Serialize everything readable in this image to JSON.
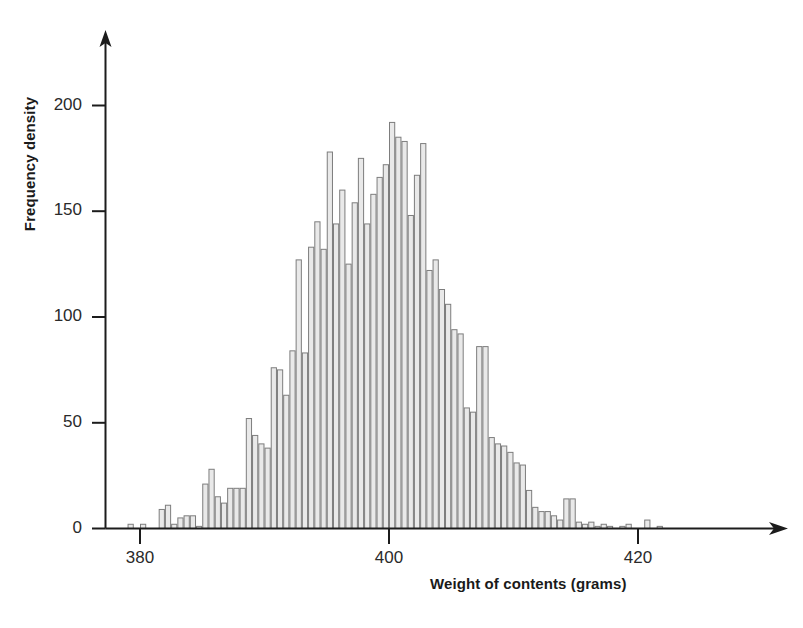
{
  "chart_data": {
    "type": "bar",
    "title": "",
    "subtitle": "",
    "xlabel": "Weight of contents (grams)",
    "ylabel": "Frequency density",
    "grid": false,
    "legend": false,
    "legend_position": "none",
    "xlim": [
      378.0,
      429.0
    ],
    "ylim": [
      0,
      215
    ],
    "xticks": [
      380,
      400,
      420
    ],
    "xtick_labels": [
      "380",
      "400",
      "420"
    ],
    "yticks": [
      0,
      50,
      100,
      150,
      200
    ],
    "ytick_labels": [
      "0",
      "50",
      "100",
      "150",
      "200"
    ],
    "bin_width": 0.5,
    "bar_fill": "#e9e9e9",
    "bar_stroke": "#7d7d7d",
    "axis_color": "#1c1c1c",
    "categories": [
      379.0,
      379.5,
      380.0,
      380.5,
      381.0,
      381.5,
      382.0,
      382.5,
      383.0,
      383.5,
      384.0,
      384.5,
      385.0,
      385.5,
      386.0,
      386.5,
      387.0,
      387.5,
      388.0,
      388.5,
      389.0,
      389.5,
      390.0,
      390.5,
      391.0,
      391.5,
      392.0,
      392.5,
      393.0,
      393.5,
      394.0,
      394.5,
      395.0,
      395.5,
      396.0,
      396.5,
      397.0,
      397.5,
      398.0,
      398.5,
      399.0,
      399.5,
      400.0,
      400.5,
      401.0,
      401.5,
      402.0,
      402.5,
      403.0,
      403.5,
      404.0,
      404.5,
      405.0,
      405.5,
      406.0,
      406.5,
      407.0,
      407.5,
      408.0,
      408.5,
      409.0,
      409.5,
      410.0,
      410.5,
      411.0,
      411.5,
      412.0,
      412.5,
      413.0,
      413.5,
      414.0,
      414.5,
      415.0,
      415.5,
      416.0,
      416.5,
      417.0,
      417.5,
      418.0,
      418.5,
      419.0,
      419.5,
      420.0,
      420.5,
      421.0,
      421.5,
      422.0,
      422.5,
      423.0
    ],
    "values": [
      2,
      0,
      2,
      0,
      0,
      9,
      11,
      2,
      5,
      6,
      6,
      1,
      21,
      28,
      15,
      12,
      19,
      19,
      19,
      52,
      44,
      40,
      38,
      76,
      75,
      63,
      84,
      127,
      83,
      133,
      145,
      132,
      178,
      144,
      160,
      125,
      154,
      175,
      144,
      158,
      166,
      172,
      192,
      185,
      183,
      148,
      167,
      182,
      122,
      127,
      113,
      106,
      94,
      92,
      57,
      55,
      86,
      86,
      43,
      40,
      39,
      36,
      31,
      30,
      18,
      10,
      8,
      8,
      6,
      4,
      14,
      14,
      3,
      2,
      3,
      1,
      2,
      1,
      0,
      1,
      2,
      0,
      0,
      4,
      0,
      1,
      0,
      0,
      0
    ]
  },
  "axes": {
    "x_axis_name": "x-axis",
    "y_axis_name": "y-axis"
  }
}
